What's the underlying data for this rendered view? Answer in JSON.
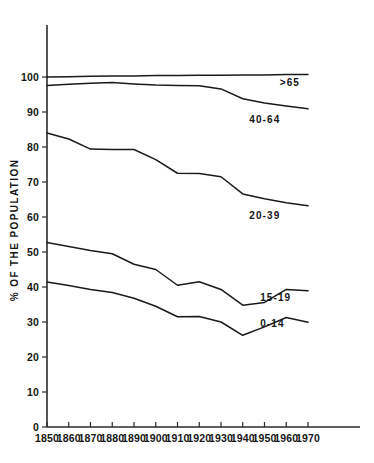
{
  "chart_data": {
    "type": "line",
    "title": "",
    "subtitle": "",
    "xlabel": "",
    "ylabel": "% OF THE POPULATION",
    "x": [
      1850,
      1860,
      1870,
      1880,
      1890,
      1900,
      1910,
      1920,
      1930,
      1940,
      1950,
      1960,
      1970
    ],
    "xlim": [
      1850,
      1970
    ],
    "ylim": [
      0,
      105
    ],
    "yticks": [
      0,
      10,
      20,
      30,
      40,
      50,
      60,
      70,
      80,
      90,
      100
    ],
    "xticks": [
      "1850",
      "1860",
      "1870",
      "1880",
      "1890",
      "1900",
      "1910",
      "1920",
      "1930",
      "1940",
      "1950",
      "1960",
      "1970"
    ],
    "grid": false,
    "legend_position": "right-inline",
    "line_color": "#1a1a1a",
    "series": [
      {
        "name": ">65",
        "label": ">65",
        "values": [
          100.0,
          100.1,
          100.2,
          100.3,
          100.3,
          100.4,
          100.4,
          100.5,
          100.5,
          100.6,
          100.6,
          100.7,
          100.7
        ]
      },
      {
        "name": "40-64",
        "label": "40-64",
        "values": [
          97.6,
          97.9,
          98.2,
          98.4,
          98.0,
          97.7,
          97.6,
          97.5,
          96.6,
          93.8,
          92.6,
          91.7,
          90.9
        ]
      },
      {
        "name": "20-39",
        "label": "20-39",
        "values": [
          84.0,
          82.3,
          79.4,
          79.3,
          79.3,
          76.4,
          72.5,
          72.4,
          71.5,
          66.6,
          65.2,
          64.1,
          63.2
        ]
      },
      {
        "name": "15-19",
        "label": "15-19",
        "values": [
          52.7,
          51.6,
          50.4,
          49.5,
          46.5,
          45.0,
          40.5,
          41.5,
          39.3,
          34.8,
          35.6,
          39.3,
          38.9
        ]
      },
      {
        "name": "0-14",
        "label": "0-14",
        "values": [
          41.4,
          40.4,
          39.3,
          38.4,
          36.8,
          34.5,
          31.5,
          31.6,
          30.0,
          26.2,
          28.6,
          31.3,
          29.9
        ]
      }
    ],
    "series_label_positions": [
      {
        "name": ">65",
        "x": 1957,
        "y": 97.5
      },
      {
        "name": "40-64",
        "x": 1943,
        "y": 87.0
      },
      {
        "name": "20-39",
        "x": 1943,
        "y": 59.5
      },
      {
        "name": "15-19",
        "x": 1948,
        "y": 36.0
      },
      {
        "name": "0-14",
        "x": 1948,
        "y": 28.5
      }
    ]
  }
}
